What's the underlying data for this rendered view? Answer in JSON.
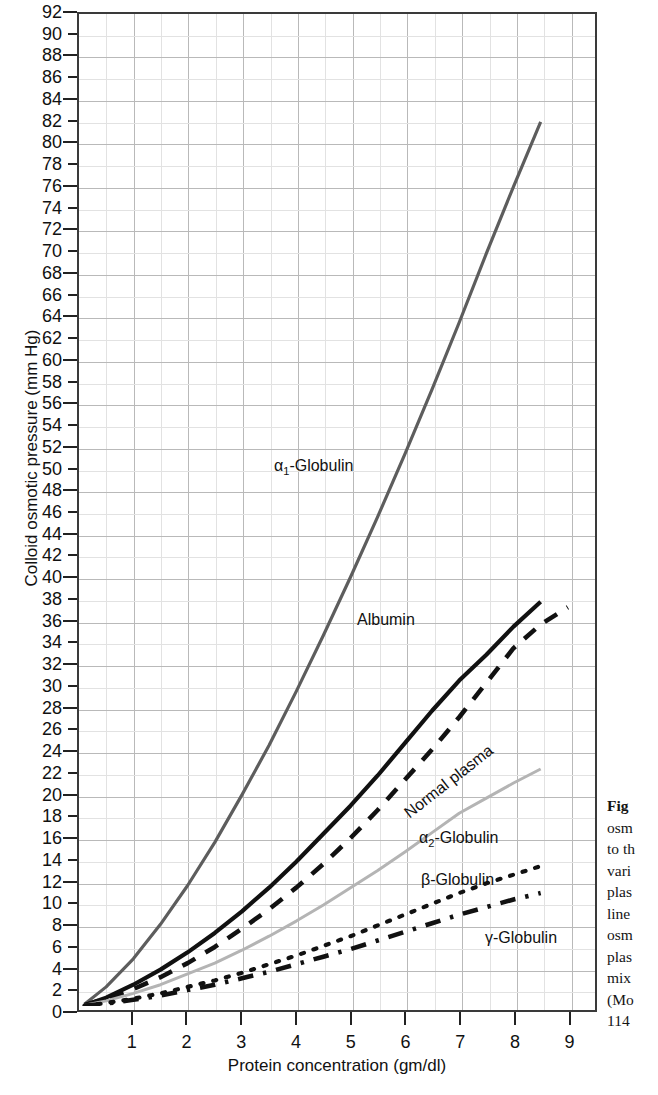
{
  "figure": {
    "caption_lead": "Fig",
    "caption_lines": [
      "osm",
      "to th",
      "vari",
      "plas",
      "line",
      "osm",
      "plas",
      "mix",
      "(Mo",
      "114"
    ]
  },
  "axes": {
    "y_title": "Colloid osmotic pressure (mm Hg)",
    "x_title": "Protein concentration (gm/dl)",
    "y_ticks": [
      0,
      2,
      4,
      6,
      8,
      10,
      12,
      14,
      16,
      18,
      20,
      22,
      24,
      26,
      28,
      30,
      32,
      34,
      36,
      38,
      40,
      42,
      44,
      46,
      48,
      50,
      52,
      54,
      56,
      58,
      60,
      62,
      64,
      66,
      68,
      70,
      72,
      74,
      76,
      78,
      80,
      82,
      84,
      86,
      88,
      90,
      92
    ],
    "x_ticks": [
      1,
      2,
      3,
      4,
      5,
      6,
      7,
      8,
      9
    ]
  },
  "labels": {
    "alpha1": "α1-Globulin",
    "alpha1_base": "α",
    "alpha1_sub": "1",
    "alpha1_rest": "-Globulin",
    "albumin": "Albumin",
    "normal_plasma": "Normal plasma",
    "alpha2_base": "α",
    "alpha2_sub": "2",
    "alpha2_rest": "-Globulin",
    "beta": "β-Globulin",
    "gamma": "γ-Globulin"
  },
  "colors": {
    "alpha1": "#5d5d5d",
    "albumin": "#111111",
    "normal_plasma": "#111111",
    "alpha2": "#b4b4b4",
    "beta": "#111111",
    "gamma": "#111111",
    "axis": "#3a3a3a",
    "grid_major": "#b9b9b9",
    "grid_minor": "#e2e2e2"
  },
  "chart_data": {
    "type": "line",
    "title": "",
    "xlabel": "Protein concentration (gm/dl)",
    "ylabel": "Colloid osmotic pressure (mm Hg)",
    "xlim": [
      0,
      9.5
    ],
    "ylim": [
      0,
      92
    ],
    "grid": true,
    "legend": "inline-labels",
    "x_tick_step": 1,
    "y_tick_step": 2,
    "series": [
      {
        "name": "α1-Globulin",
        "style": "solid",
        "color": "#5d5d5d",
        "x": [
          0.1,
          0.5,
          1.0,
          1.5,
          2.0,
          2.5,
          3.0,
          3.5,
          4.0,
          4.5,
          5.0,
          5.5,
          6.0,
          6.5,
          7.0,
          7.5,
          8.0,
          8.5
        ],
        "y": [
          0.2,
          1.8,
          4.4,
          7.6,
          11.2,
          15.2,
          19.6,
          24.2,
          29.2,
          34.4,
          39.8,
          45.4,
          51.2,
          57.2,
          63.4,
          69.8,
          76.0,
          82.0
        ]
      },
      {
        "name": "Albumin",
        "style": "solid",
        "color": "#111111",
        "x": [
          0.1,
          0.5,
          1.0,
          1.5,
          2.0,
          2.5,
          3.0,
          3.5,
          4.0,
          4.5,
          5.0,
          5.5,
          6.0,
          6.5,
          7.0,
          7.5,
          8.0,
          8.5
        ],
        "y": [
          0.1,
          0.8,
          2.0,
          3.4,
          5.0,
          6.8,
          8.8,
          11.0,
          13.4,
          16.0,
          18.6,
          21.4,
          24.4,
          27.4,
          30.2,
          32.6,
          35.2,
          37.5
        ]
      },
      {
        "name": "Normal plasma",
        "style": "dashed",
        "color": "#111111",
        "x": [
          0.1,
          0.5,
          1.0,
          1.5,
          2.0,
          2.5,
          3.0,
          3.5,
          4.0,
          4.5,
          5.0,
          5.5,
          6.0,
          6.5,
          7.0,
          7.5,
          8.0,
          8.5,
          9.0
        ],
        "y": [
          0.1,
          0.7,
          1.6,
          2.7,
          4.0,
          5.5,
          7.2,
          9.0,
          11.0,
          13.2,
          15.6,
          18.2,
          21.0,
          23.8,
          26.8,
          30.0,
          33.2,
          35.4,
          37.0
        ]
      },
      {
        "name": "α2-Globulin",
        "style": "solid",
        "color": "#b4b4b4",
        "x": [
          0.1,
          0.5,
          1.0,
          1.5,
          2.0,
          2.5,
          3.0,
          3.5,
          4.0,
          4.5,
          5.0,
          5.5,
          6.0,
          6.5,
          7.0,
          7.5,
          8.0,
          8.5
        ],
        "y": [
          0.1,
          0.5,
          1.2,
          2.0,
          3.0,
          4.0,
          5.2,
          6.5,
          7.9,
          9.4,
          11.0,
          12.6,
          14.3,
          16.1,
          17.9,
          19.3,
          20.7,
          22.0
        ]
      },
      {
        "name": "β-Globulin",
        "style": "dotted",
        "color": "#111111",
        "x": [
          0.1,
          0.5,
          1.0,
          1.5,
          2.0,
          2.5,
          3.0,
          3.5,
          4.0,
          4.5,
          5.0,
          5.5,
          6.0,
          6.5,
          7.0,
          7.5,
          8.0,
          8.5
        ],
        "y": [
          0.05,
          0.3,
          0.7,
          1.2,
          1.8,
          2.4,
          3.1,
          3.9,
          4.7,
          5.6,
          6.5,
          7.5,
          8.5,
          9.5,
          10.5,
          11.4,
          12.2,
          13.0
        ]
      },
      {
        "name": "γ-Globulin",
        "style": "dashdot",
        "color": "#111111",
        "x": [
          0.1,
          0.5,
          1.0,
          1.5,
          2.0,
          2.5,
          3.0,
          3.5,
          4.0,
          4.5,
          5.0,
          5.5,
          6.0,
          6.5,
          7.0,
          7.5,
          8.0,
          8.5
        ],
        "y": [
          0.05,
          0.25,
          0.6,
          1.0,
          1.5,
          2.0,
          2.6,
          3.2,
          3.9,
          4.6,
          5.3,
          6.1,
          6.9,
          7.7,
          8.5,
          9.2,
          9.9,
          10.5
        ]
      }
    ]
  }
}
